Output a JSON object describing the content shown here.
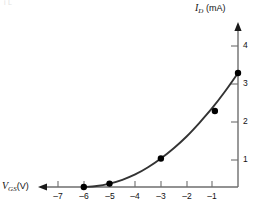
{
  "figure": {
    "faint_header": "i   L        ",
    "background_color": "#ffffff",
    "curve_color": "#333333",
    "axis_color": "#6e6e6e",
    "marker_color": "#000000"
  },
  "axes": {
    "y": {
      "label_var": "I",
      "label_sub": "D",
      "label_unit": "(mA)",
      "ticks": [
        "4",
        "3",
        "2",
        "1"
      ],
      "tick_values": [
        4,
        3,
        2,
        1
      ],
      "arrow": "up"
    },
    "x": {
      "label_var": "V",
      "label_sub": "GS",
      "label_unit": "(V)",
      "ticks": [
        "–7",
        "–6",
        "–5",
        "–4",
        "–3",
        "–2",
        "–1"
      ],
      "tick_values": [
        -7,
        -6,
        -5,
        -4,
        -3,
        -2,
        -1
      ],
      "arrow": "left"
    }
  },
  "chart_data": {
    "type": "line",
    "title": "",
    "xlabel": "V_GS (V)",
    "ylabel": "I_D (mA)",
    "xlim": [
      -7.6,
      0.35
    ],
    "ylim": [
      0,
      4.55
    ],
    "grid": false,
    "legend": null,
    "series": [
      {
        "name": "I_D vs V_GS transfer characteristic",
        "markers": true,
        "points": [
          {
            "x": -6.0,
            "y": 0.0
          },
          {
            "x": -5.0,
            "y": 0.09
          },
          {
            "x": -3.0,
            "y": 0.75
          },
          {
            "x": -0.9,
            "y": 2.0
          },
          {
            "x": 0.0,
            "y": 3.0
          }
        ],
        "curve": [
          {
            "x": -6.0,
            "y": 0.0
          },
          {
            "x": -5.5,
            "y": 0.025
          },
          {
            "x": -5.0,
            "y": 0.09
          },
          {
            "x": -4.5,
            "y": 0.19
          },
          {
            "x": -4.0,
            "y": 0.33
          },
          {
            "x": -3.5,
            "y": 0.52
          },
          {
            "x": -3.0,
            "y": 0.75
          },
          {
            "x": -2.5,
            "y": 1.02
          },
          {
            "x": -2.0,
            "y": 1.33
          },
          {
            "x": -1.5,
            "y": 1.69
          },
          {
            "x": -1.0,
            "y": 2.08
          },
          {
            "x": -0.5,
            "y": 2.52
          },
          {
            "x": 0.0,
            "y": 3.0
          }
        ]
      }
    ]
  },
  "geometry": {
    "origin_x": 238,
    "origin_y": 187,
    "x_unit_px": 25.7,
    "y_unit_px": 38.0
  }
}
